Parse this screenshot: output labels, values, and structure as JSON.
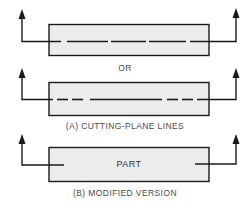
{
  "figure": {
    "separator_label": "OR",
    "caption_a": "(A) CUTTING-PLANE LINES",
    "caption_b": "(B) MODIFIED VERSION",
    "part_label": "PART"
  },
  "views": [
    {
      "id": "a1",
      "line_style": "long-dash",
      "description": "Cutting-plane line with long dashes through part"
    },
    {
      "id": "a2",
      "line_style": "long-short-dash",
      "description": "Cutting-plane line with short dashes near ends and long center dash"
    },
    {
      "id": "b",
      "line_style": "ends-only",
      "description": "Modified version with line segments only at ends"
    }
  ],
  "colors": {
    "part_fill": "#ececec",
    "stroke": "#1a1a1a",
    "caption_text": "#4a4a4a"
  }
}
